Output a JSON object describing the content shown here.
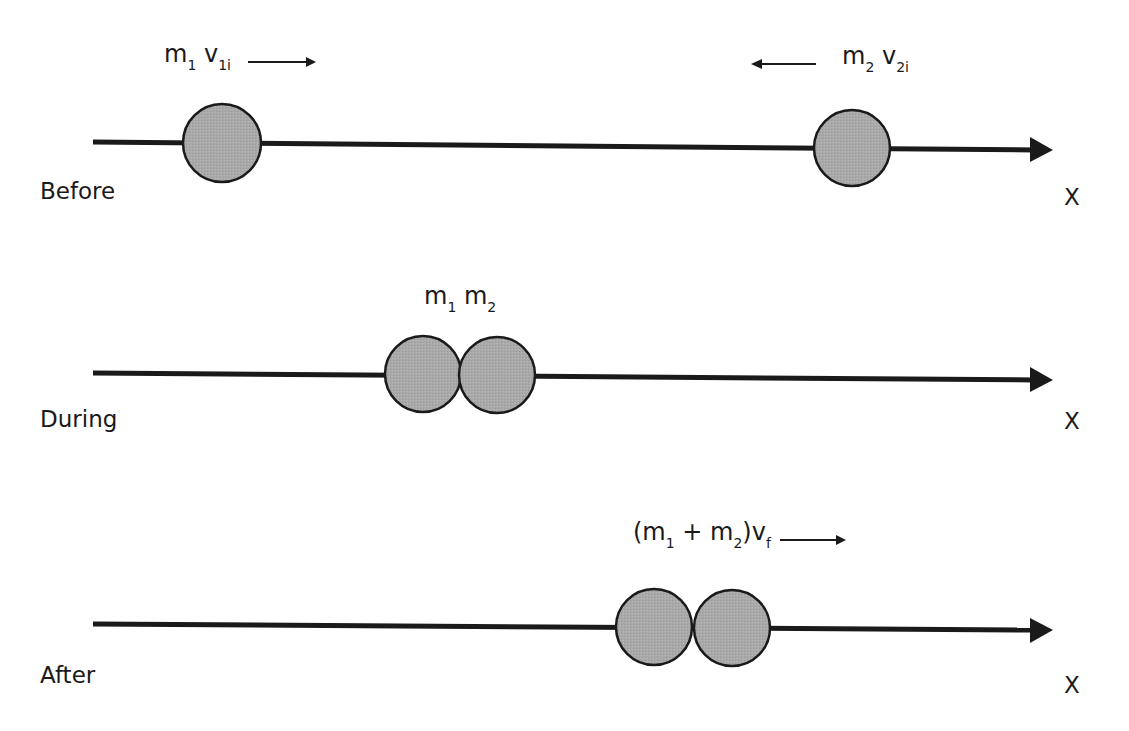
{
  "diagram": {
    "type": "perfectly inelastic collision",
    "colors": {
      "ball_fill": "#a9a9a9",
      "stroke": "#1a1a1a",
      "background": "#ffffff"
    },
    "panels": [
      {
        "stage": "Before",
        "axis_label": "X",
        "labels": [
          {
            "base": "m",
            "sub": "1",
            "base2": "v",
            "sub2": "1i",
            "arrow": "right"
          },
          {
            "base": "m",
            "sub": "2",
            "base2": "v",
            "sub2": "2i",
            "arrow": "left"
          }
        ]
      },
      {
        "stage": "During",
        "axis_label": "X",
        "labels": [
          {
            "base": "m",
            "sub": "1",
            "base2": "m",
            "sub2": "2"
          }
        ]
      },
      {
        "stage": "After",
        "axis_label": "X",
        "labels": [
          {
            "prefix": "(m",
            "sub": "1",
            "mid": " + m",
            "sub2": "2",
            "suffix": ")v",
            "sub3": "f",
            "arrow": "right"
          }
        ]
      }
    ]
  }
}
